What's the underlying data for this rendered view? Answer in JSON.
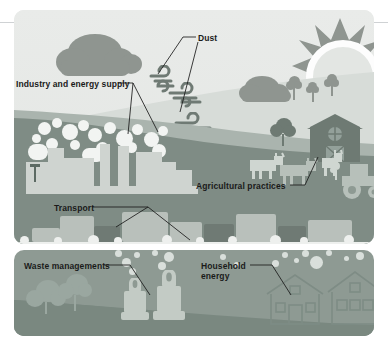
{
  "figure": {
    "panels": [
      {
        "id": "upper",
        "name": "landscape-panel"
      },
      {
        "id": "lower",
        "name": "residential-panel"
      }
    ]
  },
  "labels": [
    {
      "id": "dust",
      "text": "Dust",
      "x": 198,
      "y": 33
    },
    {
      "id": "industry",
      "text": "Industry and energy supply",
      "x": 16,
      "y": 79
    },
    {
      "id": "agriculture",
      "text": "Agricultural practices",
      "x": 196,
      "y": 181
    },
    {
      "id": "transport",
      "text": "Transport",
      "x": 54,
      "y": 203
    },
    {
      "id": "waste",
      "text": "Waste managements",
      "x": 24,
      "y": 261
    },
    {
      "id": "household",
      "text": "Household\nenergy",
      "x": 201,
      "y": 261
    }
  ],
  "icons": [
    {
      "name": "sun-icon",
      "count": 1
    },
    {
      "name": "cloud-icon",
      "count": 2
    },
    {
      "name": "wind-swirl-icon",
      "count": 3
    },
    {
      "name": "tree-icon",
      "count": 7
    },
    {
      "name": "factory-icon",
      "count": 1
    },
    {
      "name": "smoke-plume-icon",
      "count": 1
    },
    {
      "name": "cow-icon",
      "count": 3
    },
    {
      "name": "barn-icon",
      "count": 1
    },
    {
      "name": "tractor-icon",
      "count": 1
    },
    {
      "name": "vehicle-icon",
      "count": 9
    },
    {
      "name": "waste-bin-icon",
      "count": 2
    },
    {
      "name": "house-icon",
      "count": 2
    },
    {
      "name": "bubble-icon",
      "count": 18
    }
  ],
  "colors": {
    "page_background": "#ffffff",
    "sky": "#e6e8e6",
    "hill_far": "#d7dcd8",
    "hill_mid": "#aab4ae",
    "hill_near": "#7f8c85",
    "panel_lower": "#8e9a93",
    "silhouette": "#8f9590",
    "highlight": "#f2f4f2",
    "label_text": "#1a1a1a",
    "hairline": "#cfd2d4"
  }
}
